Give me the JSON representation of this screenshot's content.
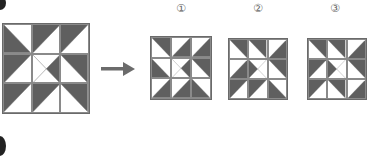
{
  "colors": {
    "dark": "#5f5f5f",
    "line": "#7a7a7a",
    "arrow": "#6b6b6b"
  },
  "problem": {
    "original": [
      [
        "ll",
        "ul",
        "ul"
      ],
      [
        "ul",
        "xr",
        "ur"
      ],
      [
        "ul",
        "ul",
        "ur"
      ]
    ],
    "arrow_icon": "right-arrow-icon"
  },
  "options": [
    {
      "label": "①",
      "cells": [
        [
          "ur",
          "lr",
          "lr"
        ],
        [
          "ll",
          "xr",
          "ur"
        ],
        [
          "lr",
          "lr",
          "ll"
        ]
      ]
    },
    {
      "label": "②",
      "cells": [
        [
          "ur",
          "ur",
          "lr"
        ],
        [
          "lr",
          "xl",
          "ur"
        ],
        [
          "ul",
          "ul",
          "ll"
        ]
      ]
    },
    {
      "label": "③",
      "cells": [
        [
          "ur",
          "ur",
          "lr"
        ],
        [
          "ul",
          "xl",
          "ur"
        ],
        [
          "ul",
          "ur",
          "lr"
        ]
      ]
    }
  ]
}
